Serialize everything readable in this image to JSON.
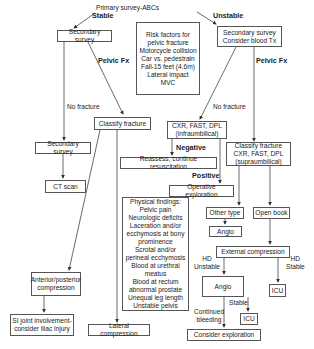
{
  "title": "Primary survey-ABCs",
  "branches": {
    "stable": "Stable",
    "unstable": "Unstable"
  },
  "nodes": {
    "primary": "Primary survey-ABCs",
    "secondary_stable": "Secondary survey",
    "risk_factors": "Risk factors for\npelvic fracture\nMotorcycle collision\nCar vs. pedestrain\nFall-15 feet (4.6m)\nLateral impact\nMVC",
    "secondary_unstable": "Secondary survey\nConsider blood Tx",
    "classify_stable": "Classify fracture",
    "secondary_survey_2": "Secondary survey",
    "ct_scan": "CT scan",
    "cxr_infra": "CXR, FAST, DPL\n(infraumbilical)",
    "reassess": "Reassess, continue resuscitation",
    "classify_unstable": "Classify fracture\nCXR, FAST, DPL\n(supraumbilical)",
    "operative": "Operative exploration",
    "other_type": "Other type",
    "open_book": "Open book",
    "angio_small": "Angio",
    "physical_findings": "Physical findings:\nPelvic pain\nNeurologic deficits\nLaceration and/or\necchymosis at bony\nprominence\nScrotal and/or\nperineal ecchymosis\nBlood at urethral\nmeatus\nBlood at rectum\nabnormal prostate\nUnequal leg length\nUnstable pelvis",
    "external_compression": "External compression",
    "ap_compression": "Anterior/posterior\ncompression",
    "angio_large": "Angio",
    "icu_right": "ICU",
    "icu_small": "ICU",
    "si_joint": "SI joint involvement-\nconsider iliac injury",
    "lateral_compression": "Lateral compression",
    "consider_exploration": "Consider exploration"
  },
  "edge_labels": {
    "pelvic_fx_left": "Pelvic Fx",
    "pelvic_fx_right": "Pelvic Fx",
    "no_fracture_left": "No fracture",
    "no_fracture_right": "No fracture",
    "negative": "Negative",
    "positive": "Positive",
    "hd_unstable": "HD\nUnstable",
    "hd_stable": "HD\nStable",
    "stable": "Stable",
    "continued_bleeding": "Continued\nbleeding"
  },
  "colors": {
    "line": "#444444",
    "border": "#555555",
    "background": "#ffffff"
  }
}
